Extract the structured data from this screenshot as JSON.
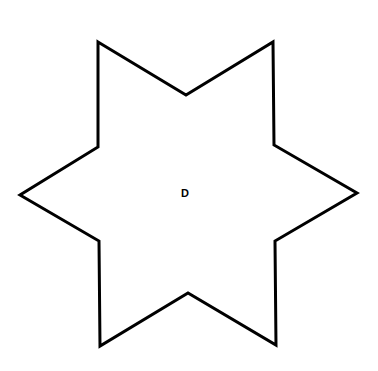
{
  "diagram": {
    "shape": "six-pointed star (hexagram outline)",
    "stroke_color": "#000000",
    "fill_color": "#ffffff",
    "stroke_width": 3,
    "vertices": [
      [
        98,
        42
      ],
      [
        186,
        95
      ],
      [
        273,
        42
      ],
      [
        274,
        145
      ],
      [
        357,
        193
      ],
      [
        275,
        241
      ],
      [
        276,
        345
      ],
      [
        188,
        293
      ],
      [
        100,
        346
      ],
      [
        99,
        241
      ],
      [
        20,
        195
      ],
      [
        98,
        147
      ]
    ],
    "center_label": {
      "text": "D",
      "x": 185,
      "y": 197,
      "font_size": 11
    }
  }
}
